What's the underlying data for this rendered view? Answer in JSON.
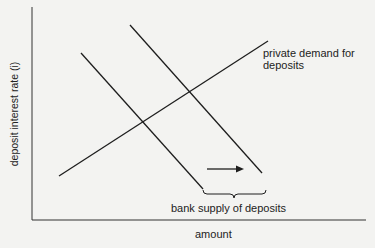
{
  "diagram": {
    "type": "supply-demand",
    "axes": {
      "y_label": "deposit interest rate (i)",
      "x_label": "amount"
    },
    "curves": [
      {
        "name": "bank supply of deposits (initial)",
        "kind": "supply",
        "from": [
          81,
          53
        ],
        "to": [
          203,
          189
        ]
      },
      {
        "name": "bank supply of deposits (shifted)",
        "kind": "supply",
        "from": [
          130,
          25
        ],
        "to": [
          262,
          173
        ]
      },
      {
        "name": "private demand for deposits",
        "kind": "demand",
        "from": [
          59,
          176
        ],
        "to": [
          268,
          41
        ]
      }
    ],
    "labels": {
      "demand": "private demand for deposits",
      "supply": "bank supply of deposits"
    },
    "annotations": {
      "shift_arrow": "rightward shift of supply"
    },
    "colors": {
      "line": "#1e1e1e",
      "background": "#f3f3f1"
    }
  }
}
